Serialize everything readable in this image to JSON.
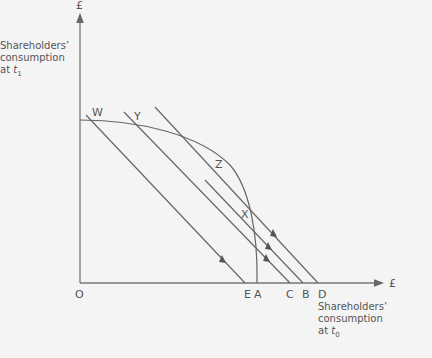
{
  "diagram": {
    "y_axis": {
      "unit_label": "£",
      "title_line1": "Shareholders’",
      "title_line2": "consumption",
      "title_line3_prefix": "at ",
      "title_line3_var": "t",
      "title_line3_sub": "1"
    },
    "x_axis": {
      "unit_label": "£",
      "title_line1": "Shareholders’",
      "title_line2": "consumption",
      "title_line3_prefix": "at ",
      "title_line3_var": "t",
      "title_line3_sub": "0"
    },
    "origin_label": "O",
    "points": {
      "W": "W",
      "Y": "Y",
      "Z": "Z",
      "X": "X"
    },
    "x_intercepts": {
      "E": "E",
      "A": "A",
      "C": "C",
      "B": "B",
      "D": "D"
    },
    "colors": {
      "line": "#666666",
      "background": "#f4f4f4",
      "text": "#555555"
    }
  }
}
